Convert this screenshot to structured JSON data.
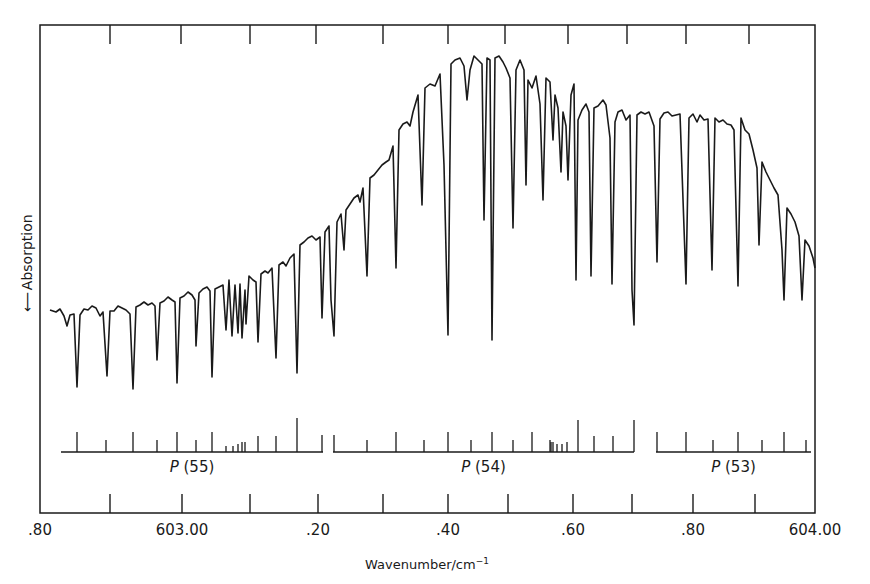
{
  "chart_data": {
    "type": "line",
    "title": "",
    "xlabel": "Wavenumber/cm⁻¹",
    "xlabel_base": "Wavenumber/cm",
    "xlabel_sup": "−1",
    "ylabel": "Absorption",
    "ylabel_arrow": "down",
    "xlim": [
      602.8,
      604.0
    ],
    "x_tick_labels": [
      ".80",
      "603.00",
      ".20",
      ".40",
      ".60",
      ".80",
      "604.00"
    ],
    "x_tick_values": [
      602.8,
      603.0,
      603.2,
      603.4,
      603.6,
      603.8,
      604.0
    ],
    "grid": false,
    "legend": null,
    "data_note": "Approximate reconstruction. The trace vertices and dip depths below are rough pixel-coordinate estimates read off the screenshot's overall shape; individual lines were not measured against an axis. Tick-mark x-positions and axis labels are read from zoomed crops and are more reliable.",
    "branches": [
      {
        "label": "P",
        "number": "(55)",
        "x_start": 61,
        "x_end": 323
      },
      {
        "label": "P",
        "number": "(54)",
        "x_start": 333,
        "x_end": 634
      },
      {
        "label": "P",
        "number": "(53)",
        "x_start": 656,
        "x_end": 811
      }
    ],
    "assignment_ticks_p55": [
      [
        77,
        20
      ],
      [
        106,
        12
      ],
      [
        133,
        20
      ],
      [
        157,
        12
      ],
      [
        177,
        20
      ],
      [
        196,
        12
      ],
      [
        212,
        20
      ],
      [
        226,
        6
      ],
      [
        233,
        6
      ],
      [
        238,
        8
      ],
      [
        242,
        10
      ],
      [
        245,
        10
      ],
      [
        258,
        16
      ],
      [
        276,
        16
      ],
      [
        297,
        34
      ],
      [
        322,
        17
      ]
    ],
    "assignment_ticks_p54": [
      [
        334,
        17
      ],
      [
        367,
        12
      ],
      [
        396,
        20
      ],
      [
        424,
        12
      ],
      [
        448,
        20
      ],
      [
        471,
        12
      ],
      [
        492,
        20
      ],
      [
        513,
        12
      ],
      [
        532,
        20
      ],
      [
        550,
        12
      ],
      [
        551,
        10
      ],
      [
        553,
        10
      ],
      [
        557,
        8
      ],
      [
        562,
        8
      ],
      [
        567,
        10
      ],
      [
        578,
        32
      ],
      [
        594,
        16
      ],
      [
        613,
        16
      ],
      [
        634,
        32
      ]
    ],
    "assignment_ticks_p53": [
      [
        657,
        20
      ],
      [
        686,
        20
      ],
      [
        713,
        12
      ],
      [
        738,
        20
      ],
      [
        762,
        12
      ],
      [
        784,
        20
      ],
      [
        806,
        12
      ]
    ],
    "trace_points_approx": [
      [
        50,
        310
      ],
      [
        56,
        312
      ],
      [
        60,
        309
      ],
      [
        64,
        316
      ],
      [
        67,
        326
      ],
      [
        70,
        315
      ],
      [
        74,
        314
      ],
      [
        77,
        387
      ],
      [
        80,
        315
      ],
      [
        84,
        309
      ],
      [
        88,
        310
      ],
      [
        92,
        306
      ],
      [
        96,
        308
      ],
      [
        100,
        316
      ],
      [
        103,
        312
      ],
      [
        107,
        376
      ],
      [
        110,
        311
      ],
      [
        114,
        311
      ],
      [
        118,
        306
      ],
      [
        122,
        308
      ],
      [
        126,
        310
      ],
      [
        130,
        314
      ],
      [
        133,
        389
      ],
      [
        136,
        307
      ],
      [
        140,
        305
      ],
      [
        144,
        302
      ],
      [
        148,
        305
      ],
      [
        152,
        303
      ],
      [
        155,
        306
      ],
      [
        157,
        360
      ],
      [
        160,
        303
      ],
      [
        164,
        301
      ],
      [
        168,
        297
      ],
      [
        172,
        300
      ],
      [
        175,
        302
      ],
      [
        177,
        383
      ],
      [
        180,
        298
      ],
      [
        184,
        296
      ],
      [
        188,
        292
      ],
      [
        192,
        295
      ],
      [
        195,
        300
      ],
      [
        196,
        346
      ],
      [
        199,
        293
      ],
      [
        203,
        289
      ],
      [
        207,
        287
      ],
      [
        210,
        291
      ],
      [
        212,
        377
      ],
      [
        215,
        289
      ],
      [
        219,
        287
      ],
      [
        223,
        285
      ],
      [
        226,
        330
      ],
      [
        229,
        280
      ],
      [
        232,
        336
      ],
      [
        235,
        285
      ],
      [
        238,
        333
      ],
      [
        240,
        284
      ],
      [
        242,
        338
      ],
      [
        245,
        290
      ],
      [
        246,
        324
      ],
      [
        249,
        276
      ],
      [
        253,
        280
      ],
      [
        256,
        282
      ],
      [
        258,
        342
      ],
      [
        261,
        274
      ],
      [
        265,
        271
      ],
      [
        268,
        273
      ],
      [
        272,
        268
      ],
      [
        276,
        358
      ],
      [
        279,
        265
      ],
      [
        283,
        262
      ],
      [
        286,
        266
      ],
      [
        290,
        258
      ],
      [
        294,
        254
      ],
      [
        297,
        373
      ],
      [
        300,
        245
      ],
      [
        304,
        242
      ],
      [
        308,
        238
      ],
      [
        312,
        236
      ],
      [
        316,
        240
      ],
      [
        320,
        237
      ],
      [
        322,
        318
      ],
      [
        325,
        232
      ],
      [
        329,
        226
      ],
      [
        331,
        300
      ],
      [
        334,
        336
      ],
      [
        337,
        222
      ],
      [
        341,
        214
      ],
      [
        344,
        250
      ],
      [
        346,
        210
      ],
      [
        350,
        204
      ],
      [
        354,
        198
      ],
      [
        358,
        195
      ],
      [
        360,
        202
      ],
      [
        363,
        188
      ],
      [
        367,
        276
      ],
      [
        370,
        178
      ],
      [
        374,
        175
      ],
      [
        378,
        170
      ],
      [
        382,
        165
      ],
      [
        386,
        162
      ],
      [
        389,
        160
      ],
      [
        393,
        146
      ],
      [
        396,
        268
      ],
      [
        399,
        130
      ],
      [
        403,
        124
      ],
      [
        407,
        122
      ],
      [
        410,
        126
      ],
      [
        413,
        112
      ],
      [
        418,
        95
      ],
      [
        422,
        205
      ],
      [
        425,
        88
      ],
      [
        430,
        84
      ],
      [
        435,
        86
      ],
      [
        440,
        74
      ],
      [
        444,
        165
      ],
      [
        448,
        335
      ],
      [
        451,
        64
      ],
      [
        455,
        60
      ],
      [
        460,
        58
      ],
      [
        464,
        66
      ],
      [
        467,
        100
      ],
      [
        470,
        70
      ],
      [
        474,
        56
      ],
      [
        478,
        60
      ],
      [
        482,
        64
      ],
      [
        484,
        220
      ],
      [
        487,
        58
      ],
      [
        490,
        60
      ],
      [
        492,
        340
      ],
      [
        495,
        58
      ],
      [
        499,
        56
      ],
      [
        503,
        62
      ],
      [
        506,
        68
      ],
      [
        510,
        78
      ],
      [
        513,
        228
      ],
      [
        516,
        70
      ],
      [
        520,
        60
      ],
      [
        524,
        70
      ],
      [
        526,
        185
      ],
      [
        528,
        80
      ],
      [
        532,
        88
      ],
      [
        536,
        76
      ],
      [
        540,
        104
      ],
      [
        543,
        200
      ],
      [
        546,
        78
      ],
      [
        550,
        82
      ],
      [
        553,
        140
      ],
      [
        555,
        95
      ],
      [
        558,
        108
      ],
      [
        561,
        172
      ],
      [
        563,
        112
      ],
      [
        566,
        126
      ],
      [
        568,
        180
      ],
      [
        571,
        95
      ],
      [
        574,
        84
      ],
      [
        576,
        280
      ],
      [
        578,
        120
      ],
      [
        582,
        110
      ],
      [
        586,
        104
      ],
      [
        589,
        112
      ],
      [
        591,
        276
      ],
      [
        594,
        108
      ],
      [
        598,
        106
      ],
      [
        603,
        100
      ],
      [
        606,
        105
      ],
      [
        610,
        138
      ],
      [
        612,
        284
      ],
      [
        615,
        122
      ],
      [
        618,
        112
      ],
      [
        622,
        110
      ],
      [
        626,
        120
      ],
      [
        630,
        115
      ],
      [
        632,
        290
      ],
      [
        634,
        325
      ],
      [
        637,
        115
      ],
      [
        641,
        112
      ],
      [
        645,
        114
      ],
      [
        649,
        112
      ],
      [
        654,
        126
      ],
      [
        657,
        262
      ],
      [
        660,
        119
      ],
      [
        664,
        113
      ],
      [
        668,
        112
      ],
      [
        672,
        116
      ],
      [
        676,
        115
      ],
      [
        680,
        114
      ],
      [
        686,
        284
      ],
      [
        689,
        118
      ],
      [
        693,
        114
      ],
      [
        697,
        122
      ],
      [
        700,
        115
      ],
      [
        704,
        120
      ],
      [
        708,
        119
      ],
      [
        712,
        270
      ],
      [
        715,
        118
      ],
      [
        719,
        122
      ],
      [
        723,
        120
      ],
      [
        727,
        124
      ],
      [
        731,
        125
      ],
      [
        734,
        130
      ],
      [
        738,
        286
      ],
      [
        741,
        118
      ],
      [
        745,
        130
      ],
      [
        749,
        134
      ],
      [
        753,
        150
      ],
      [
        757,
        168
      ],
      [
        759,
        245
      ],
      [
        762,
        162
      ],
      [
        766,
        172
      ],
      [
        770,
        180
      ],
      [
        774,
        188
      ],
      [
        778,
        195
      ],
      [
        782,
        250
      ],
      [
        784,
        300
      ],
      [
        787,
        208
      ],
      [
        791,
        214
      ],
      [
        795,
        222
      ],
      [
        799,
        236
      ],
      [
        802,
        300
      ],
      [
        805,
        240
      ],
      [
        809,
        246
      ],
      [
        813,
        258
      ],
      [
        815,
        268
      ]
    ]
  },
  "axes": {
    "frame": {
      "left": 40,
      "right": 815,
      "top": 25,
      "bottom": 513
    },
    "bottom_ticks_x": [
      110,
      182,
      250,
      318,
      383,
      448,
      508,
      573,
      632,
      693,
      755
    ],
    "top_ticks_x": [
      110,
      181,
      250,
      316,
      383,
      448,
      505,
      568,
      627,
      686,
      749
    ],
    "label_positions_x": [
      40,
      182,
      318,
      448,
      573,
      693,
      815
    ]
  }
}
